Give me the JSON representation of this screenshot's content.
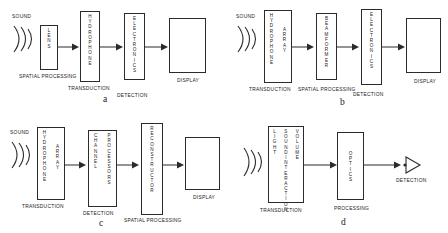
{
  "figure": {
    "line_color": "#2b2b2b",
    "background": "#ffffff",
    "sound_label": "SOUND",
    "icons": {
      "sound_wave": "sound-wave-icon",
      "arrow": "arrow-right-icon",
      "detector": "detector-triangle-icon"
    }
  },
  "panels": [
    {
      "letter": "a",
      "source_label": "SOUND",
      "blocks": [
        {
          "name": "lens",
          "columns": [
            "LENS"
          ],
          "caption": "SPATIAL PROCESSING"
        },
        {
          "name": "hydrophone",
          "columns": [
            "HYDROPHONE"
          ],
          "caption": "TRANSDUCTION"
        },
        {
          "name": "electronics",
          "columns": [
            "ELECTRONICS"
          ],
          "caption": "DETECTION"
        },
        {
          "name": "display",
          "columns": [],
          "caption": "DISPLAY"
        }
      ]
    },
    {
      "letter": "b",
      "source_label": "SOUND",
      "blocks": [
        {
          "name": "hydrophone-array",
          "columns": [
            "HYDROPHONE",
            "ARRAY"
          ],
          "caption": "TRANSDUCTION"
        },
        {
          "name": "beamformer",
          "columns": [
            "BEAMFORMER"
          ],
          "caption": "SPATIAL PROCESSING"
        },
        {
          "name": "electronics",
          "columns": [
            "ELECTRONICS"
          ],
          "caption": "DETECTION"
        },
        {
          "name": "display",
          "columns": [],
          "caption": "DISPLAY"
        }
      ]
    },
    {
      "letter": "c",
      "source_label": "SOUND",
      "blocks": [
        {
          "name": "hydrophone-array",
          "columns": [
            "HYDROPHONE",
            "ARRAY"
          ],
          "caption": "TRANSDUCTION"
        },
        {
          "name": "channel-processors",
          "columns": [
            "CHANNEL",
            "PROCESSORS"
          ],
          "caption": "DETECTION"
        },
        {
          "name": "reconstructor",
          "columns": [
            "RECONSTRUCTOR"
          ],
          "caption": "SPATIAL PROCESSING"
        },
        {
          "name": "display",
          "columns": [],
          "caption": "DISPLAY"
        }
      ]
    },
    {
      "letter": "d",
      "source_label": "",
      "blocks": [
        {
          "name": "light-sound-interaction-volume",
          "columns": [
            "LIGHT",
            "SOUND INTERACTION",
            "VOLUME"
          ],
          "caption": "TRANSDUCTION"
        },
        {
          "name": "optics",
          "columns": [
            "OPTICS"
          ],
          "caption": "PROCESSING"
        },
        {
          "name": "detector",
          "columns": [],
          "caption": "DETECTION"
        }
      ]
    }
  ]
}
